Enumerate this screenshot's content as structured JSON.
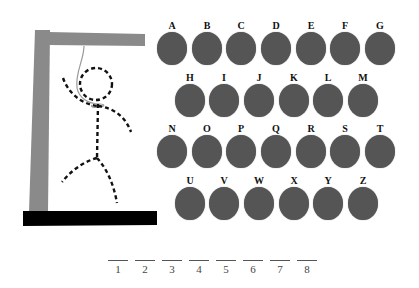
{
  "game": {
    "title": "Hangman",
    "colors": {
      "letter_disc": "#555555",
      "gallows_wood": "#8a8a8a",
      "gallows_base": "#000000",
      "figure": "#111111",
      "rope": "#9a9a9a"
    },
    "gallows_icon": "gallows-with-dashed-stick-figure",
    "letters": [
      {
        "row": 0,
        "label": "A"
      },
      {
        "row": 0,
        "label": "B"
      },
      {
        "row": 0,
        "label": "C"
      },
      {
        "row": 0,
        "label": "D"
      },
      {
        "row": 0,
        "label": "E"
      },
      {
        "row": 0,
        "label": "F"
      },
      {
        "row": 0,
        "label": "G"
      },
      {
        "row": 1,
        "label": "H"
      },
      {
        "row": 1,
        "label": "I"
      },
      {
        "row": 1,
        "label": "J"
      },
      {
        "row": 1,
        "label": "K"
      },
      {
        "row": 1,
        "label": "L"
      },
      {
        "row": 1,
        "label": "M"
      },
      {
        "row": 2,
        "label": "N"
      },
      {
        "row": 2,
        "label": "O"
      },
      {
        "row": 2,
        "label": "P"
      },
      {
        "row": 2,
        "label": "Q"
      },
      {
        "row": 2,
        "label": "R"
      },
      {
        "row": 2,
        "label": "S"
      },
      {
        "row": 2,
        "label": "T"
      },
      {
        "row": 3,
        "label": "U"
      },
      {
        "row": 3,
        "label": "V"
      },
      {
        "row": 3,
        "label": "W"
      },
      {
        "row": 3,
        "label": "X"
      },
      {
        "row": 3,
        "label": "Y"
      },
      {
        "row": 3,
        "label": "Z"
      }
    ],
    "blanks": [
      {
        "index": "1",
        "value": ""
      },
      {
        "index": "2",
        "value": ""
      },
      {
        "index": "3",
        "value": ""
      },
      {
        "index": "4",
        "value": ""
      },
      {
        "index": "5",
        "value": ""
      },
      {
        "index": "6",
        "value": ""
      },
      {
        "index": "7",
        "value": ""
      },
      {
        "index": "8",
        "value": ""
      }
    ]
  }
}
